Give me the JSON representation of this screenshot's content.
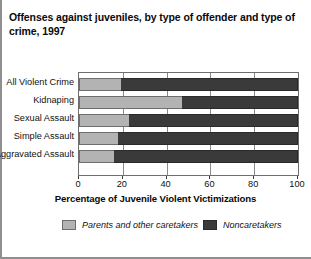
{
  "title": "Offenses against juveniles, by type of offender and type of crime, 1997",
  "colors": {
    "caretakers": "#b3b3b3",
    "noncaretakers": "#3a3a3a",
    "axis": "#6e6e6e",
    "grid": "#8a8a8a"
  },
  "chart_data": {
    "type": "bar",
    "orientation": "horizontal",
    "stacked": true,
    "stack_mode": "percent",
    "title": "Offenses against juveniles, by type of offender and type of crime, 1997",
    "xlabel": "Percentage of Juvenile Violent Victimizations",
    "ylabel": "",
    "xlim": [
      0,
      100
    ],
    "xticks": [
      0,
      20,
      40,
      60,
      80,
      100
    ],
    "xtick_labels": [
      "0",
      "20",
      "40",
      "60",
      "80",
      "100"
    ],
    "grid": true,
    "legend_position": "bottom",
    "categories": [
      "All Violent Crime",
      "Kidnaping",
      "Sexual Assault",
      "Simple Assault",
      "Aggravated Assault"
    ],
    "series": [
      {
        "name": "Parents and other caretakers",
        "color": "#b3b3b3",
        "values": [
          19,
          47,
          23,
          18,
          16
        ]
      },
      {
        "name": "Noncaretakers",
        "color": "#3a3a3a",
        "values": [
          81,
          53,
          77,
          82,
          84
        ]
      }
    ]
  },
  "legend": [
    {
      "label": "Parents and other caretakers",
      "swatch": "light"
    },
    {
      "label": "Noncaretakers",
      "swatch": "dark"
    }
  ]
}
